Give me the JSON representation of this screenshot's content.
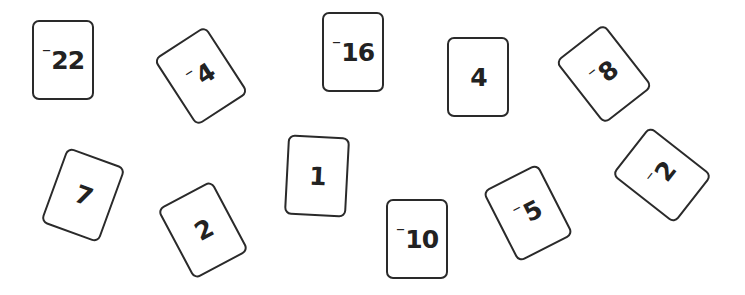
{
  "cards": [
    {
      "id": "c1",
      "sign": "⁻",
      "num": "22",
      "left": 32,
      "top": 20,
      "rot": 0
    },
    {
      "id": "c2",
      "sign": "⁻",
      "num": "4",
      "left": 170,
      "top": 36,
      "rot": -33
    },
    {
      "id": "c3",
      "sign": "⁻",
      "num": "16",
      "left": 322,
      "top": 12,
      "rot": 0
    },
    {
      "id": "c4",
      "sign": "",
      "num": "4",
      "left": 447,
      "top": 37,
      "rot": 0
    },
    {
      "id": "c5",
      "sign": "⁻",
      "num": "8",
      "left": 573,
      "top": 34,
      "rot": -38
    },
    {
      "id": "c6",
      "sign": "",
      "num": "7",
      "left": 52,
      "top": 155,
      "rot": 20
    },
    {
      "id": "c7",
      "sign": "",
      "num": "2",
      "left": 172,
      "top": 190,
      "rot": -28
    },
    {
      "id": "c8",
      "sign": "",
      "num": "1",
      "left": 286,
      "top": 136,
      "rot": 3
    },
    {
      "id": "c9",
      "sign": "⁻",
      "num": "10",
      "left": 386,
      "top": 199,
      "rot": 0
    },
    {
      "id": "c10",
      "sign": "⁻",
      "num": "5",
      "left": 497,
      "top": 173,
      "rot": -27
    },
    {
      "id": "c11",
      "sign": "⁻",
      "num": "2",
      "left": 631,
      "top": 135,
      "rot": -52
    }
  ],
  "colors": {
    "border": "#2a2a2a",
    "text": "#222222",
    "background": "#ffffff"
  }
}
